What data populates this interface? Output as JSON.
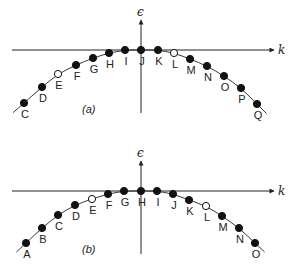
{
  "diagram": {
    "axis_labels": {
      "vertical": "ϵ",
      "horizontal": "k"
    },
    "colors": {
      "ink": "#222222",
      "background": "#ffffff"
    },
    "panels": [
      {
        "id": "a",
        "caption": "(a)",
        "origin": [
          141,
          50
        ],
        "points": [
          {
            "label": "C",
            "x": 24,
            "y": 103,
            "filled": true
          },
          {
            "label": "D",
            "x": 42,
            "y": 87,
            "filled": true
          },
          {
            "label": "E",
            "x": 58,
            "y": 74,
            "filled": false
          },
          {
            "label": "F",
            "x": 76,
            "y": 65,
            "filled": true
          },
          {
            "label": "G",
            "x": 93,
            "y": 58,
            "filled": true
          },
          {
            "label": "H",
            "x": 109,
            "y": 53,
            "filled": true
          },
          {
            "label": "I",
            "x": 125,
            "y": 50,
            "filled": true
          },
          {
            "label": "J",
            "x": 141,
            "y": 50,
            "filled": true
          },
          {
            "label": "K",
            "x": 158,
            "y": 50,
            "filled": true
          },
          {
            "label": "L",
            "x": 174,
            "y": 53,
            "filled": false
          },
          {
            "label": "M",
            "x": 190,
            "y": 59,
            "filled": true
          },
          {
            "label": "N",
            "x": 207,
            "y": 66,
            "filled": true
          },
          {
            "label": "O",
            "x": 224,
            "y": 76,
            "filled": true
          },
          {
            "label": "P",
            "x": 241,
            "y": 88,
            "filled": true
          },
          {
            "label": "Q",
            "x": 257,
            "y": 104,
            "filled": true
          }
        ]
      },
      {
        "id": "b",
        "caption": "(b)",
        "origin": [
          141,
          191
        ],
        "points": [
          {
            "label": "A",
            "x": 26,
            "y": 243,
            "filled": true
          },
          {
            "label": "B",
            "x": 42,
            "y": 228,
            "filled": true
          },
          {
            "label": "C",
            "x": 58,
            "y": 215,
            "filled": true
          },
          {
            "label": "D",
            "x": 75,
            "y": 205,
            "filled": true
          },
          {
            "label": "E",
            "x": 92,
            "y": 199,
            "filled": false
          },
          {
            "label": "F",
            "x": 108,
            "y": 194,
            "filled": true
          },
          {
            "label": "G",
            "x": 124,
            "y": 191,
            "filled": true
          },
          {
            "label": "H",
            "x": 141,
            "y": 191,
            "filled": true
          },
          {
            "label": "I",
            "x": 157,
            "y": 191,
            "filled": true
          },
          {
            "label": "J",
            "x": 173,
            "y": 194,
            "filled": true
          },
          {
            "label": "K",
            "x": 189,
            "y": 200,
            "filled": true
          },
          {
            "label": "L",
            "x": 206,
            "y": 206,
            "filled": false
          },
          {
            "label": "M",
            "x": 222,
            "y": 216,
            "filled": true
          },
          {
            "label": "N",
            "x": 239,
            "y": 228,
            "filled": true
          },
          {
            "label": "O",
            "x": 255,
            "y": 243,
            "filled": true
          }
        ]
      }
    ]
  }
}
